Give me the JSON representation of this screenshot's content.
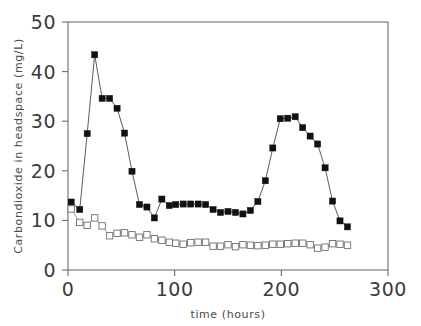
{
  "figure": {
    "background_color": "#ffffff",
    "width": 421,
    "height": 326
  },
  "chart_data": {
    "type": "line",
    "title": "",
    "xlabel": "time (hours)",
    "ylabel": "Carbondioxide in headspace (mg/L)",
    "xlim": [
      0,
      300
    ],
    "ylim": [
      0,
      50
    ],
    "xticks": [
      0,
      100,
      200,
      300
    ],
    "yticks": [
      0,
      10,
      20,
      30,
      40,
      50
    ],
    "xtick_labels": [
      "0",
      "100",
      "200",
      "300"
    ],
    "ytick_labels": [
      "0",
      "10",
      "20",
      "30",
      "40",
      "50"
    ],
    "grid": false,
    "legend": null,
    "legend_position": "none",
    "frame": "box",
    "series": [
      {
        "name": "filled-square-series",
        "marker": "filled-square",
        "marker_color": "#111111",
        "line_color": "#4a4a4a",
        "x": [
          3,
          11,
          18,
          25,
          32,
          39,
          46,
          53,
          60,
          67,
          74,
          81,
          88,
          95,
          101,
          108,
          115,
          122,
          129,
          136,
          143,
          150,
          157,
          164,
          171,
          178,
          185,
          192,
          199,
          206,
          213,
          220,
          227,
          234,
          241,
          248,
          255,
          262
        ],
        "y": [
          13.7,
          12.2,
          27.5,
          43.4,
          34.6,
          34.6,
          32.6,
          27.6,
          19.9,
          13.2,
          12.7,
          10.5,
          14.3,
          13.0,
          13.2,
          13.3,
          13.3,
          13.3,
          13.2,
          12.2,
          11.6,
          11.8,
          11.6,
          11.3,
          12.0,
          13.8,
          18.0,
          24.6,
          30.5,
          30.6,
          30.9,
          28.7,
          27.0,
          25.4,
          20.6,
          13.9,
          9.9,
          8.7
        ]
      },
      {
        "name": "open-square-series",
        "marker": "open-square",
        "marker_color": "#ffffff",
        "line_color": "#8a8a8a",
        "x": [
          3,
          11,
          18,
          25,
          32,
          39,
          46,
          53,
          60,
          67,
          74,
          81,
          88,
          95,
          101,
          108,
          115,
          122,
          129,
          136,
          143,
          150,
          157,
          164,
          171,
          178,
          185,
          192,
          199,
          206,
          213,
          220,
          227,
          234,
          241,
          248,
          255,
          262
        ],
        "y": [
          12.3,
          9.6,
          9.0,
          10.5,
          8.9,
          6.9,
          7.4,
          7.5,
          7.1,
          6.6,
          7.1,
          6.3,
          6.0,
          5.6,
          5.4,
          5.2,
          5.5,
          5.6,
          5.6,
          4.8,
          4.8,
          5.1,
          4.7,
          5.1,
          5.0,
          4.9,
          5.0,
          5.2,
          5.2,
          5.3,
          5.4,
          5.4,
          5.1,
          4.4,
          4.6,
          5.3,
          5.2,
          5.0
        ]
      }
    ]
  },
  "axes": {
    "x_axis_name": "time-axis",
    "y_axis_name": "carbondioxide-axis"
  }
}
